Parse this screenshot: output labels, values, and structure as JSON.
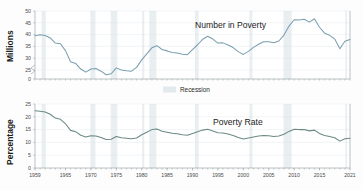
{
  "figure": {
    "background": "#fdfdfd",
    "legend": {
      "label": "Recession",
      "swatch_color": "#e3eaee"
    }
  },
  "chart_data": [
    {
      "type": "line",
      "title": "Number in Poverty",
      "xlabel": "",
      "ylabel": "Millions",
      "ylim": [
        0,
        50
      ],
      "y_break": [
        0,
        25
      ],
      "yticks": [
        0,
        25,
        30,
        35,
        40,
        45,
        50
      ],
      "xlim": [
        1959,
        2021
      ],
      "xticks": [
        1959,
        1965,
        1970,
        1975,
        1980,
        1985,
        1990,
        1995,
        2000,
        2005,
        2010,
        2015,
        2021
      ],
      "grid": true,
      "legend_position": "none",
      "line_color": "#7a9fb0",
      "annotation": "Number in Poverty",
      "x": [
        1959,
        1960,
        1961,
        1962,
        1963,
        1964,
        1965,
        1966,
        1967,
        1968,
        1969,
        1970,
        1971,
        1972,
        1973,
        1974,
        1975,
        1976,
        1977,
        1978,
        1979,
        1980,
        1981,
        1982,
        1983,
        1984,
        1985,
        1986,
        1987,
        1988,
        1989,
        1990,
        1991,
        1992,
        1993,
        1994,
        1995,
        1996,
        1997,
        1998,
        1999,
        2000,
        2001,
        2002,
        2003,
        2004,
        2005,
        2006,
        2007,
        2008,
        2009,
        2010,
        2011,
        2012,
        2013,
        2014,
        2015,
        2016,
        2017,
        2018,
        2019,
        2020,
        2021
      ],
      "values": [
        39.5,
        39.9,
        39.6,
        38.6,
        36.4,
        36.1,
        33.2,
        28.5,
        27.8,
        25.4,
        24.1,
        25.4,
        25.6,
        24.5,
        23.0,
        23.4,
        25.9,
        25.0,
        24.7,
        24.5,
        26.1,
        29.3,
        31.8,
        34.4,
        35.3,
        33.7,
        33.1,
        32.4,
        32.2,
        31.7,
        31.5,
        33.6,
        35.7,
        38.0,
        39.3,
        38.1,
        36.4,
        36.5,
        35.6,
        34.5,
        32.8,
        31.6,
        32.9,
        34.6,
        35.9,
        37.0,
        37.0,
        36.5,
        37.3,
        39.8,
        43.6,
        46.3,
        46.2,
        46.5,
        45.3,
        46.7,
        43.1,
        40.6,
        39.7,
        38.1,
        34.0,
        37.2,
        37.9
      ]
    },
    {
      "type": "line",
      "title": "Poverty Rate",
      "xlabel": "",
      "ylabel": "Percentage",
      "ylim": [
        0,
        25
      ],
      "yticks": [
        0,
        5,
        10,
        15,
        20,
        25
      ],
      "xlim": [
        1959,
        2021
      ],
      "xticks": [
        1959,
        1965,
        1970,
        1975,
        1980,
        1985,
        1990,
        1995,
        2000,
        2005,
        2010,
        2015,
        2021
      ],
      "grid": true,
      "legend_position": "none",
      "line_color": "#6b8a84",
      "annotation": "Poverty Rate",
      "x": [
        1959,
        1960,
        1961,
        1962,
        1963,
        1964,
        1965,
        1966,
        1967,
        1968,
        1969,
        1970,
        1971,
        1972,
        1973,
        1974,
        1975,
        1976,
        1977,
        1978,
        1979,
        1980,
        1981,
        1982,
        1983,
        1984,
        1985,
        1986,
        1987,
        1988,
        1989,
        1990,
        1991,
        1992,
        1993,
        1994,
        1995,
        1996,
        1997,
        1998,
        1999,
        2000,
        2001,
        2002,
        2003,
        2004,
        2005,
        2006,
        2007,
        2008,
        2009,
        2010,
        2011,
        2012,
        2013,
        2014,
        2015,
        2016,
        2017,
        2018,
        2019,
        2020,
        2021
      ],
      "values": [
        22.4,
        22.2,
        21.9,
        21.0,
        19.5,
        19.0,
        17.3,
        14.7,
        14.2,
        12.8,
        12.1,
        12.6,
        12.5,
        11.9,
        11.1,
        11.2,
        12.3,
        11.8,
        11.6,
        11.4,
        11.7,
        13.0,
        14.0,
        15.0,
        15.2,
        14.4,
        14.0,
        13.6,
        13.4,
        13.0,
        12.8,
        13.5,
        14.2,
        14.8,
        15.1,
        14.5,
        13.8,
        13.7,
        13.3,
        12.7,
        11.9,
        11.3,
        11.7,
        12.1,
        12.5,
        12.7,
        12.6,
        12.3,
        12.5,
        13.2,
        14.3,
        15.1,
        15.0,
        15.0,
        14.5,
        14.8,
        13.5,
        12.7,
        12.3,
        11.8,
        10.5,
        11.4,
        11.6
      ]
    }
  ],
  "recessions": [
    {
      "start": 1960.3,
      "end": 1961.1
    },
    {
      "start": 1969.9,
      "end": 1970.9
    },
    {
      "start": 1973.9,
      "end": 1975.2
    },
    {
      "start": 1980.1,
      "end": 1980.5
    },
    {
      "start": 1981.5,
      "end": 1982.9
    },
    {
      "start": 1990.5,
      "end": 1991.2
    },
    {
      "start": 2001.2,
      "end": 2001.8
    },
    {
      "start": 2007.9,
      "end": 2009.5
    },
    {
      "start": 2020.1,
      "end": 2020.4
    }
  ]
}
